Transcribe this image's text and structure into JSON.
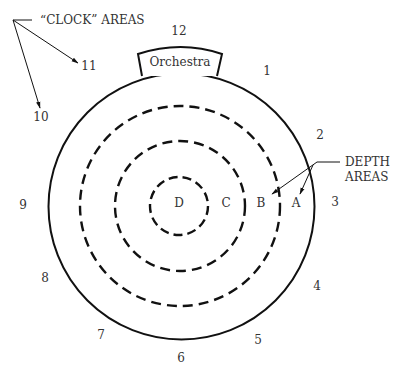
{
  "diagram": {
    "title_clock": "“CLOCK” AREAS",
    "title_depth_line1": "DEPTH",
    "title_depth_line2": "AREAS",
    "stage_label": "Orchestra",
    "clock_numbers": [
      "12",
      "1",
      "2",
      "3",
      "4",
      "5",
      "6",
      "7",
      "8",
      "9",
      "10",
      "11"
    ],
    "depth_letters": [
      "A",
      "B",
      "C",
      "D"
    ],
    "colors": {
      "line": "#111111",
      "text": "#333333",
      "background": "#ffffff"
    }
  }
}
